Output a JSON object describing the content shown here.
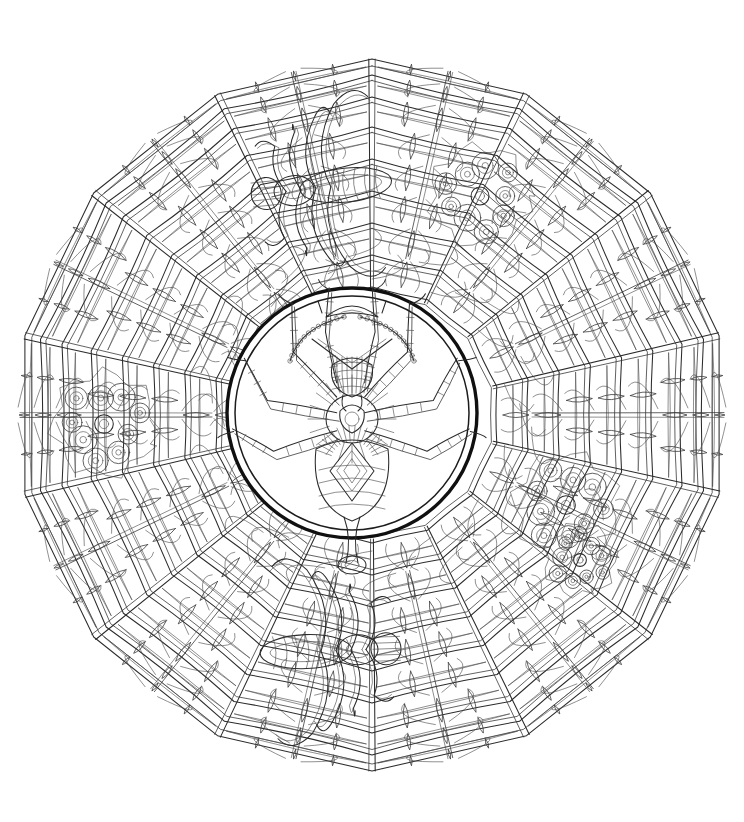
{
  "artwork": {
    "title": "Spider Mandala Coloring Page",
    "style": "black-and-white line art",
    "background_color": "#ffffff",
    "ink_color": "#2b2b2b",
    "bold_ink_color": "#101010",
    "canvas": {
      "width": 744,
      "height": 822
    }
  },
  "mandala": {
    "center": {
      "x": 372,
      "y": 415
    },
    "outer_radius": 356,
    "polygon_sides": 14,
    "rotation_degrees": -90,
    "spoke_count": 14,
    "ring_count": 9,
    "web_ring_radii": [
      128,
      160,
      192,
      224,
      256,
      288,
      318,
      340,
      356
    ]
  },
  "center_medallion": {
    "center": {
      "x": 352,
      "y": 413
    },
    "outer_radius": 125,
    "inner_radius": 117,
    "bold_border": true,
    "subject": "ornamental-spider",
    "legs_per_side": 4,
    "has_crown_ornament": true,
    "has_pendant_chain": true,
    "has_abdomen_diamond": true
  },
  "corner_motifs": [
    {
      "name": "motif-upper-right",
      "x": 480,
      "y": 196,
      "radius": 56
    },
    {
      "name": "motif-left",
      "x": 104,
      "y": 424,
      "radius": 58
    },
    {
      "name": "motif-lower-right",
      "x": 566,
      "y": 505,
      "radius": 58
    },
    {
      "name": "motif-lower-right-lower",
      "x": 580,
      "y": 560,
      "radius": 40
    }
  ],
  "edge_spiders": [
    {
      "name": "spider-top",
      "x": 300,
      "y": 190,
      "angle": -96,
      "scale": 1.0
    },
    {
      "name": "spider-bottom",
      "x": 352,
      "y": 650,
      "angle": 88,
      "scale": 1.0
    }
  ]
}
